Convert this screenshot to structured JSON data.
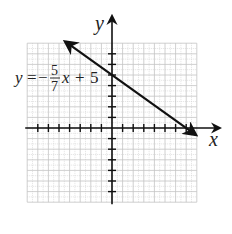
{
  "chart_data": {
    "type": "line",
    "title": "",
    "xlabel": "x",
    "ylabel": "y",
    "xlim": [
      -8,
      8
    ],
    "ylim": [
      -7,
      8
    ],
    "grid": true,
    "series": [
      {
        "name": "y = -5/7 x + 5",
        "equation": "y = -5/7 x + 5",
        "slope": -0.7142857,
        "intercept": 5,
        "x": [
          -7,
          8
        ],
        "y": [
          10,
          -0.714
        ]
      }
    ],
    "annotations": [
      {
        "text": "y = -5/7 x + 5",
        "position": "left of y-axis near y-intercept"
      }
    ],
    "y_intercept": [
      0,
      5
    ],
    "x_intercept": [
      7,
      0
    ]
  },
  "labels": {
    "x_axis": "x",
    "y_axis": "y",
    "eq_y": "y",
    "eq_eq": "=",
    "eq_minus": "−",
    "eq_num": "5",
    "eq_den": "7",
    "eq_x": "x",
    "eq_plus": "+",
    "eq_const": "5"
  }
}
